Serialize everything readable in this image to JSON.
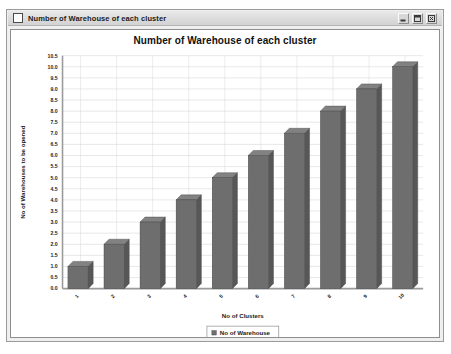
{
  "window": {
    "title": "Number of Warehouse of each cluster",
    "icon": "document-icon",
    "controls": [
      {
        "name": "minimize-button",
        "label": "Minimize"
      },
      {
        "name": "maximize-button",
        "label": "Maximize"
      },
      {
        "name": "close-button",
        "label": "Close"
      }
    ]
  },
  "colors": {
    "bar_front": "#6e6e6e",
    "bar_side": "#575757",
    "bar_top": "#828282",
    "bar_outline": "#3f3f3f",
    "grid": "#d8d8d8",
    "axis": "#9a9a9a",
    "plot_bg": "#ffffff",
    "panel_bg": "#efefef"
  },
  "chart_data": {
    "type": "bar",
    "title": "Number of Warehouse of each cluster",
    "xlabel": "No of Clusters",
    "ylabel": "No of Warehouses to be opened",
    "categories": [
      "1",
      "2",
      "3",
      "4",
      "5",
      "6",
      "7",
      "8",
      "9",
      "10"
    ],
    "values": [
      1,
      2,
      3,
      4,
      5,
      6,
      7,
      8,
      9,
      10
    ],
    "series": [
      {
        "name": "No of Warehouse",
        "values": [
          1,
          2,
          3,
          4,
          5,
          6,
          7,
          8,
          9,
          10
        ]
      }
    ],
    "ylim": [
      0.0,
      10.5
    ],
    "ytick_step": 0.5,
    "yticks": [
      "0.0",
      "0.5",
      "1.0",
      "1.5",
      "2.0",
      "2.5",
      "3.0",
      "3.5",
      "4.0",
      "4.5",
      "5.0",
      "5.5",
      "6.0",
      "6.5",
      "7.0",
      "7.5",
      "8.0",
      "8.5",
      "9.0",
      "9.5",
      "10.0",
      "10.5"
    ],
    "xtick_rotation": -45,
    "grid": true,
    "legend": {
      "position": "bottom",
      "entries": [
        {
          "label": "No of Warehouse",
          "color": "#6e6e6e"
        }
      ]
    }
  }
}
